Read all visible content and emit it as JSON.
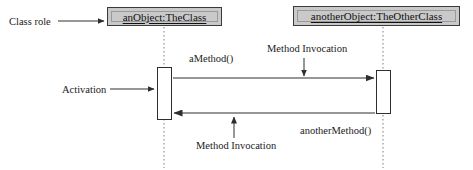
{
  "diagram": {
    "type": "uml-sequence-diagram",
    "background_color": "#ffffff",
    "line_color": "#2e2e2e",
    "box_fill_color": "#c9c9c9",
    "box_border_color": "#3a3a3a",
    "activation_fill_color": "#ffffff",
    "lifeline_style": "dotted"
  },
  "participants": [
    {
      "id": "participant-1",
      "label": "anObject:TheClass",
      "box": {
        "x": 107,
        "y": 7,
        "width": 115,
        "height": 19
      },
      "lifeline_x": 164,
      "activation": {
        "x": 157,
        "y": 67,
        "width": 15,
        "height": 53
      }
    },
    {
      "id": "participant-2",
      "label": "anotherObject:TheOtherClass",
      "box": {
        "x": 293,
        "y": 6,
        "width": 167,
        "height": 20
      },
      "lifeline_x": 383,
      "activation": {
        "x": 376,
        "y": 70,
        "width": 15,
        "height": 44
      }
    }
  ],
  "messages": [
    {
      "id": "message-1",
      "label": "aMethod()",
      "direction": "left-to-right",
      "from": "participant-1",
      "to": "participant-2",
      "y": 78,
      "label_x": 189,
      "label_y": 54
    },
    {
      "id": "message-2",
      "label": "anotherMethod()",
      "direction": "right-to-left",
      "from": "participant-2",
      "to": "participant-1",
      "y": 113,
      "label_x": 300,
      "label_y": 126
    }
  ],
  "annotations": [
    {
      "id": "annotation-class-role",
      "label": "Class role",
      "label_x": 9,
      "label_y": 17,
      "pointer": {
        "from_x": 58,
        "from_y": 21,
        "to_x": 104,
        "to_y": 21,
        "orientation": "horizontal-right"
      }
    },
    {
      "id": "annotation-activation",
      "label": "Activation",
      "label_x": 62,
      "label_y": 85,
      "pointer": {
        "from_x": 110,
        "from_y": 89,
        "to_x": 154,
        "to_y": 89,
        "orientation": "horizontal-right"
      }
    },
    {
      "id": "annotation-method-invocation-top",
      "label": "Method Invocation",
      "label_x": 267,
      "label_y": 44,
      "pointer": {
        "from_x": 304,
        "from_y": 58,
        "to_x": 304,
        "to_y": 76,
        "orientation": "vertical-down"
      }
    },
    {
      "id": "annotation-method-invocation-bottom",
      "label": "Method Invocation",
      "label_x": 196,
      "label_y": 141,
      "pointer": {
        "from_x": 234,
        "from_y": 138,
        "to_x": 234,
        "to_y": 118,
        "orientation": "vertical-up"
      }
    }
  ]
}
